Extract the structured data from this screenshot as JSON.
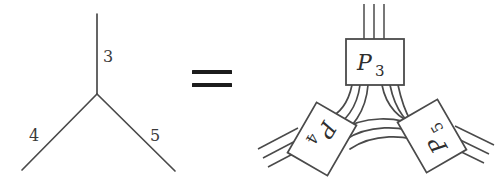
{
  "figure": {
    "kind": "tensor-network-identity-diagram",
    "background_color": "#ffffff",
    "ink_color": "#4a4a4a",
    "equals_color": "#1c1c1c"
  },
  "left_diagram": {
    "name": "trivalent-vertex",
    "description": "Y-shaped three-valent vertex with three labeled legs",
    "vertex": {
      "x": 97,
      "y": 94
    },
    "legs": [
      {
        "id": "leg-3",
        "label": "3",
        "end_x": 97,
        "end_y": 14,
        "label_x": 103,
        "label_y": 62
      },
      {
        "id": "leg-4",
        "label": "4",
        "end_x": 22,
        "end_y": 170,
        "label_x": 33,
        "label_y": 136
      },
      {
        "id": "leg-5",
        "label": "5",
        "end_x": 175,
        "end_y": 171,
        "label_x": 153,
        "label_y": 136
      }
    ]
  },
  "equals": {
    "name": "equals-sign",
    "symbol": "=",
    "x": 192,
    "y": 76,
    "bar_width": 40,
    "bar_height": 4,
    "bar_gap": 9
  },
  "right_diagram": {
    "name": "projector-network",
    "description": "Three rotated projector boxes joined pairwise by bundles of three strands, each box also carrying three free external legs",
    "strands_per_bundle": 3,
    "external_legs_per_box": 3,
    "boxes": [
      {
        "id": "box-p3",
        "letter": "P",
        "subscript": "3",
        "center_x": 375,
        "center_y": 62,
        "width": 58,
        "height": 46,
        "rotation_deg": 0
      },
      {
        "id": "box-p4",
        "letter": "P",
        "subscript": "4",
        "center_x": 322,
        "center_y": 139,
        "width": 58,
        "height": 46,
        "rotation_deg": 120
      },
      {
        "id": "box-p5",
        "letter": "P",
        "subscript": "5",
        "center_x": 432,
        "center_y": 136,
        "width": 58,
        "height": 46,
        "rotation_deg": -120
      }
    ]
  }
}
